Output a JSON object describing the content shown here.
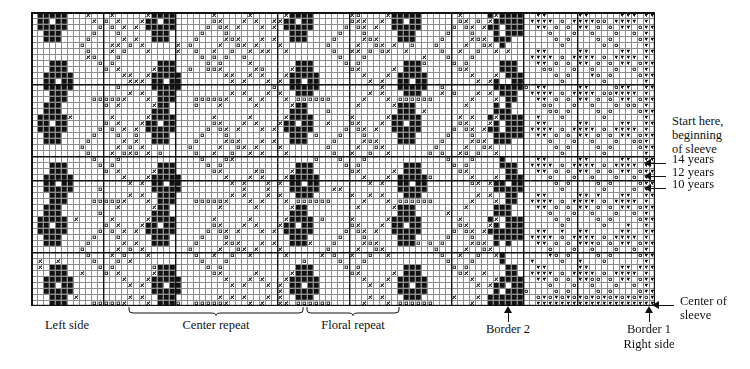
{
  "document": {
    "kind": "knitting-colorwork-chart",
    "title": "Sleeve colorwork chart"
  },
  "chart_data": {
    "type": "heatmap",
    "xlabel": "stitches",
    "ylabel": "rows",
    "grid": true,
    "legend_position": "none",
    "columns": 104,
    "rows": 49,
    "cell_px": 6,
    "origin": {
      "x": 31,
      "y": 12
    },
    "symbols": {
      "0": {
        "name": "empty",
        "glyph": "",
        "color": "#ffffff"
      },
      "1": {
        "name": "filled-square",
        "glyph": "■",
        "color": "#111111"
      },
      "2": {
        "name": "open-square",
        "glyph": "□",
        "color": "#444444"
      },
      "3": {
        "name": "cross",
        "glyph": "×",
        "color": "#333333"
      },
      "4": {
        "name": "circle",
        "glyph": "○",
        "color": "#333333"
      },
      "5": {
        "name": "triangle-down",
        "glyph": "▼",
        "color": "#111111"
      }
    },
    "heavy_column_lines": [
      0,
      12,
      24,
      41,
      53,
      70,
      82,
      91,
      104
    ],
    "heavy_row_lines": [
      0,
      12,
      24,
      28,
      40,
      49
    ],
    "motif_regions": [
      {
        "name": "left-side",
        "start_col": 0,
        "end_col": 12,
        "dominant": "filled-square"
      },
      {
        "name": "center-repeat",
        "start_col": 16,
        "end_col": 46,
        "dominant": "open-square-cross"
      },
      {
        "name": "floral-repeat",
        "start_col": 46,
        "end_col": 62,
        "dominant": "open-square-cross"
      },
      {
        "name": "border-2",
        "start_col": 79,
        "end_col": 82,
        "dominant": "filled-square"
      },
      {
        "name": "border-1",
        "start_col": 102,
        "end_col": 104,
        "dominant": "triangle-down"
      },
      {
        "name": "triangle-field",
        "start_col": 82,
        "end_col": 104,
        "dominant": "triangle-circle"
      }
    ]
  },
  "annotations": {
    "right": [
      {
        "id": "start-here",
        "lines": [
          "Start here,",
          "beginning",
          "of sleeve"
        ],
        "x": 672,
        "y": 114,
        "arrow": false
      },
      {
        "id": "years-14",
        "lines": [
          "14 years"
        ],
        "x": 672,
        "y": 157,
        "arrow": true,
        "arrow_x": 644,
        "arrow_y": 159,
        "arrow_len": 22
      },
      {
        "id": "years-12",
        "lines": [
          "12 years"
        ],
        "x": 672,
        "y": 170,
        "arrow": true,
        "arrow_x": 644,
        "arrow_y": 172,
        "arrow_len": 22
      },
      {
        "id": "years-10",
        "lines": [
          "10 years"
        ],
        "x": 672,
        "y": 182,
        "arrow": true,
        "arrow_x": 644,
        "arrow_y": 184,
        "arrow_len": 22
      },
      {
        "id": "center-of-sleeve",
        "lines": [
          "Center of",
          "sleeve"
        ],
        "x": 680,
        "y": 298,
        "arrow": true,
        "arrow_x": 652,
        "arrow_y": 301,
        "arrow_len": 22
      }
    ],
    "bottom": [
      {
        "id": "left-side",
        "lines": [
          "Left side"
        ],
        "x": 24,
        "y": 318,
        "width": 86,
        "brace": false
      },
      {
        "id": "center-repeat",
        "lines": [
          "Center repeat"
        ],
        "x": 128,
        "y": 318,
        "width": 176,
        "brace": true,
        "brace_x": 128,
        "brace_y": 306,
        "brace_w": 176
      },
      {
        "id": "floral-repeat",
        "lines": [
          "Floral repeat"
        ],
        "x": 306,
        "y": 318,
        "width": 94,
        "brace": true,
        "brace_x": 306,
        "brace_y": 306,
        "brace_w": 94
      },
      {
        "id": "border-2",
        "lines": [
          "Border 2"
        ],
        "x": 475,
        "y": 322,
        "width": 66,
        "arrow_up": true,
        "arrow_x": 504,
        "arrow_y": 306
      },
      {
        "id": "border-1-right-side",
        "lines": [
          "Border 1",
          "Right side"
        ],
        "x": 613,
        "y": 322,
        "width": 72,
        "arrow_up": true,
        "arrow_x": 645,
        "arrow_y": 306
      }
    ]
  },
  "colors": {
    "ink": "#111111",
    "grid_light": "#8c8c8c",
    "grid_heavy": "#111111",
    "paper": "#ffffff"
  }
}
